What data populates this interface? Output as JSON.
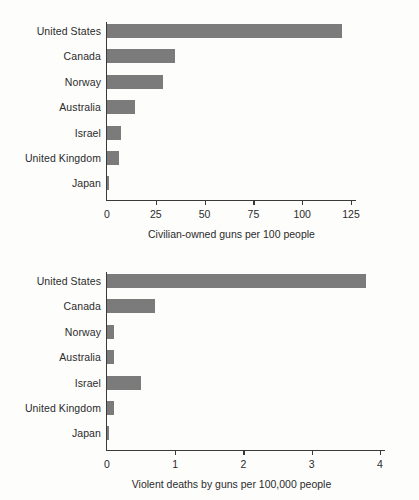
{
  "figure": {
    "background_color": "#fdfdfc",
    "bar_color": "#7b7b7b",
    "axis_color": "#3a3a3a",
    "text_color": "#2b2b2b"
  },
  "chart_data": [
    {
      "id": "civilian-owned-guns",
      "type": "bar",
      "orientation": "horizontal",
      "title": "",
      "xlabel": "Civilian-owned guns per 100 people",
      "ylabel": "",
      "categories": [
        "United States",
        "Canada",
        "Norway",
        "Australia",
        "Israel",
        "United Kingdom",
        "Japan"
      ],
      "values": [
        120.5,
        34.7,
        28.8,
        14.5,
        7.3,
        6.2,
        0.6
      ],
      "xlim": [
        0,
        130
      ],
      "xticks": [
        0,
        25,
        50,
        75,
        100,
        125
      ],
      "xtick_labels": [
        "0",
        "25",
        "50",
        "75",
        "100",
        "125"
      ],
      "grid": false,
      "legend": "none"
    },
    {
      "id": "violent-gun-deaths",
      "type": "bar",
      "orientation": "horizontal",
      "title": "",
      "xlabel": "Violent deaths by guns per 100,000 people",
      "ylabel": "",
      "categories": [
        "United States",
        "Canada",
        "Norway",
        "Australia",
        "Israel",
        "United Kingdom",
        "Japan"
      ],
      "values": [
        3.8,
        0.71,
        0.1,
        0.1,
        0.5,
        0.1,
        0.02
      ],
      "xlim": [
        0,
        4.05
      ],
      "xticks": [
        0,
        1,
        2,
        3,
        4
      ],
      "xtick_labels": [
        "0",
        "1",
        "2",
        "3",
        "4"
      ],
      "grid": false,
      "legend": "none"
    }
  ]
}
